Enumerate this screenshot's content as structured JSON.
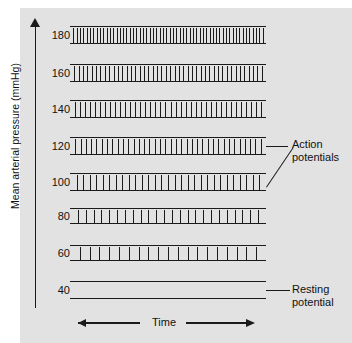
{
  "figure": {
    "panel_background": "#e2e2e2",
    "ink_color": "#1a1a1a"
  },
  "y_axis": {
    "label": "Mean arterial pressure (mmHg)",
    "arrow_icon": "up-arrow-icon",
    "ticks": [
      "180",
      "160",
      "140",
      "120",
      "100",
      "80",
      "60",
      "40"
    ]
  },
  "x_axis": {
    "label": "Time",
    "arrow_left_icon": "left-arrow-icon",
    "arrow_right_icon": "right-arrow-icon"
  },
  "annotations": {
    "action_potentials": "Action\npotentials",
    "action_potentials_line1": "Action",
    "action_potentials_line2": "potentials",
    "resting_potential_line1": "Resting",
    "resting_potential_line2": "potential"
  },
  "chart_data": {
    "type": "line",
    "title": "",
    "xlabel": "Time",
    "ylabel": "Mean arterial pressure (mmHg)",
    "grid": false,
    "legend": "none",
    "categories": [
      180,
      160,
      140,
      120,
      100,
      80,
      60,
      40
    ],
    "series": [
      {
        "name": "spike_count",
        "values": [
          58,
          44,
          38,
          36,
          29,
          24,
          19,
          0
        ]
      }
    ],
    "traces": [
      {
        "pressure": 180,
        "spike_count": 58,
        "firing": "maximal",
        "top_px": 26,
        "height_px": 18
      },
      {
        "pressure": 160,
        "spike_count": 44,
        "firing": "high",
        "top_px": 64,
        "height_px": 18
      },
      {
        "pressure": 140,
        "spike_count": 38,
        "firing": "high",
        "top_px": 100,
        "height_px": 18
      },
      {
        "pressure": 120,
        "spike_count": 36,
        "firing": "moderate",
        "top_px": 137,
        "height_px": 18
      },
      {
        "pressure": 100,
        "spike_count": 29,
        "firing": "moderate",
        "top_px": 173,
        "height_px": 18
      },
      {
        "pressure": 80,
        "spike_count": 24,
        "firing": "low",
        "top_px": 208,
        "height_px": 16
      },
      {
        "pressure": 60,
        "spike_count": 19,
        "firing": "sparse",
        "top_px": 245,
        "height_px": 16
      },
      {
        "pressure": 40,
        "spike_count": 0,
        "firing": "none",
        "top_px": 281,
        "height_px": 18
      }
    ],
    "ylim": [
      40,
      180
    ],
    "ytick_step": 20
  }
}
